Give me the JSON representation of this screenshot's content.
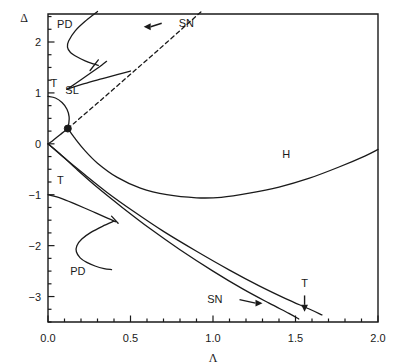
{
  "figure": {
    "kind": "bifurcation-diagram",
    "top_caption": "",
    "background": "#ffffff",
    "line_color": "#1a1a1a"
  },
  "axes": {
    "x": {
      "label": "Λ",
      "min": 0.0,
      "max": 2.0,
      "ticks": [
        0.0,
        0.5,
        1.0,
        1.5,
        2.0
      ],
      "tick_labels": [
        "0.0",
        "0.5",
        "1.0",
        "1.5",
        "2.0"
      ],
      "minor_step": 0.1
    },
    "y": {
      "label": "Δ",
      "min": -3.5,
      "max": 2.55,
      "ticks": [
        2,
        1,
        0,
        -1,
        -2,
        -3
      ],
      "tick_labels": [
        "2",
        "1",
        "0",
        "−1",
        "−2",
        "−3"
      ],
      "minor_step": 0.25
    }
  },
  "chart_data": {
    "type": "line",
    "title": "",
    "xlabel": "Λ",
    "ylabel": "Δ",
    "xlim": [
      0.0,
      2.0
    ],
    "ylim": [
      -3.5,
      2.55
    ],
    "grid": false,
    "legend": "none",
    "markers": [
      {
        "name": "codim-two-point",
        "x": 0.12,
        "y": 0.3,
        "style": "filled-circle",
        "size_px": 7
      }
    ],
    "annotations": [
      {
        "text": "PD",
        "x": 0.055,
        "y": 2.28,
        "kind": "curve-label"
      },
      {
        "text": "SN",
        "x": 0.78,
        "y": 2.3,
        "kind": "arrow-label",
        "arrow_to_x": 0.58,
        "arrow_to_y": 2.3
      },
      {
        "text": "T",
        "x": 0.015,
        "y": 1.12,
        "kind": "curve-label"
      },
      {
        "text": "SL",
        "x": 0.105,
        "y": 0.98,
        "kind": "curve-label"
      },
      {
        "text": "H",
        "x": 1.42,
        "y": -0.28,
        "kind": "curve-label"
      },
      {
        "text": "T",
        "x": 0.055,
        "y": -0.78,
        "kind": "curve-label"
      },
      {
        "text": "PD",
        "x": 0.135,
        "y": -2.58,
        "kind": "curve-label"
      },
      {
        "text": "SN",
        "x": 1.07,
        "y": -3.13,
        "kind": "arrow-label",
        "arrow_to_x": 1.3,
        "arrow_to_y": -3.13
      },
      {
        "text": "T",
        "x": 1.555,
        "y": -2.88,
        "kind": "arrow-label",
        "arrow_to_x": 1.555,
        "arrow_to_y": -3.3
      }
    ],
    "series": [
      {
        "name": "SN-dashed",
        "style": "dashed",
        "points": [
          [
            0.12,
            0.3
          ],
          [
            0.3,
            0.8
          ],
          [
            0.48,
            1.31
          ],
          [
            0.66,
            1.82
          ],
          [
            0.84,
            2.34
          ],
          [
            0.93,
            2.6
          ]
        ]
      },
      {
        "name": "PD-upper",
        "style": "solid",
        "points": [
          [
            0.3,
            2.6
          ],
          [
            0.23,
            2.42
          ],
          [
            0.165,
            2.22
          ],
          [
            0.125,
            2.02
          ],
          [
            0.118,
            1.9
          ],
          [
            0.135,
            1.8
          ],
          [
            0.175,
            1.71
          ],
          [
            0.225,
            1.63
          ],
          [
            0.275,
            1.57
          ],
          [
            0.305,
            1.54
          ]
        ]
      },
      {
        "name": "SL-branch-a",
        "style": "solid",
        "points": [
          [
            0.115,
            1.07
          ],
          [
            0.2,
            1.26
          ],
          [
            0.28,
            1.44
          ],
          [
            0.325,
            1.545
          ],
          [
            0.355,
            1.62
          ]
        ]
      },
      {
        "name": "SL-branch-b",
        "style": "solid",
        "points": [
          [
            0.115,
            1.07
          ],
          [
            0.22,
            1.18
          ],
          [
            0.33,
            1.28
          ],
          [
            0.43,
            1.37
          ],
          [
            0.5,
            1.43
          ]
        ]
      },
      {
        "name": "T-upper-loop",
        "style": "solid",
        "points": [
          [
            0.0,
            0.93
          ],
          [
            0.045,
            0.9
          ],
          [
            0.085,
            0.81
          ],
          [
            0.115,
            0.68
          ],
          [
            0.128,
            0.53
          ],
          [
            0.126,
            0.4
          ],
          [
            0.12,
            0.3
          ]
        ]
      },
      {
        "name": "T-upper-to-origin",
        "style": "solid",
        "points": [
          [
            0.12,
            0.3
          ],
          [
            0.085,
            0.21
          ],
          [
            0.05,
            0.12
          ],
          [
            0.02,
            0.04
          ],
          [
            0.0,
            0.0
          ]
        ]
      },
      {
        "name": "H-curve",
        "style": "solid",
        "points": [
          [
            0.12,
            0.3
          ],
          [
            0.16,
            0.12
          ],
          [
            0.22,
            -0.12
          ],
          [
            0.3,
            -0.38
          ],
          [
            0.42,
            -0.66
          ],
          [
            0.56,
            -0.87
          ],
          [
            0.72,
            -1.0
          ],
          [
            0.9,
            -1.06
          ],
          [
            1.05,
            -1.05
          ],
          [
            1.22,
            -0.97
          ],
          [
            1.4,
            -0.85
          ],
          [
            1.58,
            -0.68
          ],
          [
            1.76,
            -0.46
          ],
          [
            1.92,
            -0.24
          ],
          [
            2.0,
            -0.11
          ]
        ]
      },
      {
        "name": "SN-lower-left",
        "style": "solid",
        "points": [
          [
            0.0,
            0.0
          ],
          [
            0.08,
            -0.22
          ],
          [
            0.18,
            -0.52
          ],
          [
            0.3,
            -0.86
          ],
          [
            0.45,
            -1.25
          ],
          [
            0.62,
            -1.67
          ],
          [
            0.8,
            -2.08
          ],
          [
            1.0,
            -2.5
          ],
          [
            1.18,
            -2.85
          ],
          [
            1.34,
            -3.13
          ],
          [
            1.46,
            -3.33
          ],
          [
            1.52,
            -3.44
          ]
        ]
      },
      {
        "name": "SN-lower-right",
        "style": "solid",
        "points": [
          [
            0.0,
            0.0
          ],
          [
            0.1,
            -0.28
          ],
          [
            0.22,
            -0.6
          ],
          [
            0.36,
            -0.96
          ],
          [
            0.52,
            -1.33
          ],
          [
            0.7,
            -1.72
          ],
          [
            0.9,
            -2.11
          ],
          [
            1.1,
            -2.48
          ],
          [
            1.28,
            -2.79
          ],
          [
            1.44,
            -3.04
          ],
          [
            1.58,
            -3.24
          ],
          [
            1.66,
            -3.36
          ]
        ]
      },
      {
        "name": "T-lower",
        "style": "solid",
        "points": [
          [
            0.0,
            -1.0
          ],
          [
            0.08,
            -1.07
          ],
          [
            0.17,
            -1.19
          ],
          [
            0.27,
            -1.33
          ],
          [
            0.36,
            -1.46
          ],
          [
            0.41,
            -1.53
          ]
        ]
      },
      {
        "name": "PD-lower",
        "style": "solid",
        "points": [
          [
            0.4,
            -1.52
          ],
          [
            0.33,
            -1.62
          ],
          [
            0.26,
            -1.74
          ],
          [
            0.205,
            -1.87
          ],
          [
            0.175,
            -2.0
          ],
          [
            0.172,
            -2.12
          ],
          [
            0.195,
            -2.24
          ],
          [
            0.235,
            -2.33
          ],
          [
            0.285,
            -2.4
          ],
          [
            0.34,
            -2.45
          ],
          [
            0.385,
            -2.47
          ]
        ]
      },
      {
        "name": "T-lower-tick",
        "style": "solid",
        "points": [
          [
            0.385,
            -1.42
          ],
          [
            0.425,
            -1.56
          ]
        ]
      },
      {
        "name": "PD-upper-tick",
        "style": "solid",
        "points": [
          [
            0.255,
            1.44
          ],
          [
            0.305,
            1.65
          ]
        ]
      }
    ]
  }
}
